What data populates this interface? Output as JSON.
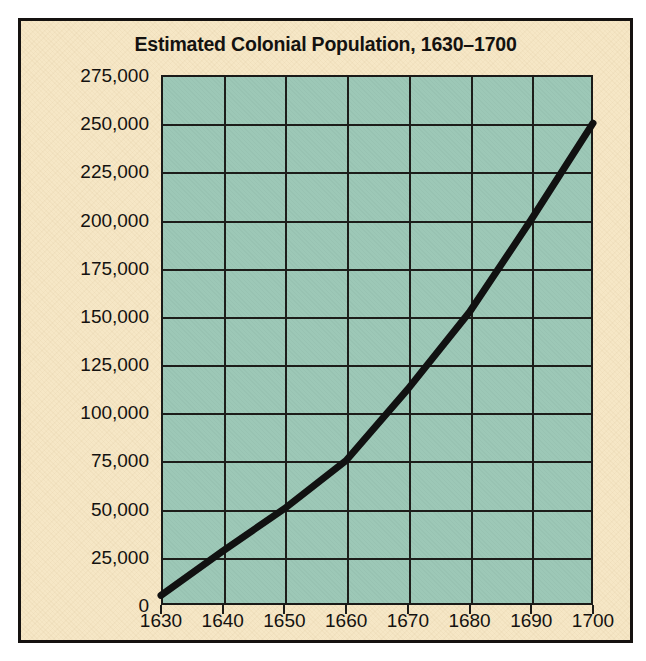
{
  "figure": {
    "background_color": "#f6e7c6",
    "border_color": "#151210",
    "plot_background_color": "#9dc8b7",
    "grid_color": "#1d1d1a",
    "line_color": "#111111"
  },
  "chart_data": {
    "type": "line",
    "title": "Estimated Colonial Population, 1630–1700",
    "xlabel": "",
    "ylabel": "",
    "x": [
      1630,
      1640,
      1650,
      1660,
      1670,
      1680,
      1690,
      1700
    ],
    "values": [
      5000,
      28000,
      50000,
      75000,
      112000,
      152000,
      200000,
      250000
    ],
    "xtick_labels": [
      "1630",
      "1640",
      "1650",
      "1660",
      "1670",
      "1680",
      "1690",
      "1700"
    ],
    "ytick_labels": [
      "275,000",
      "250,000",
      "225,000",
      "200,000",
      "175,000",
      "150,000",
      "125,000",
      "100,000",
      "75,000",
      "50,000",
      "25,000",
      "0"
    ],
    "ytick_values": [
      275000,
      250000,
      225000,
      200000,
      175000,
      150000,
      125000,
      100000,
      75000,
      50000,
      25000,
      0
    ],
    "xlim": [
      1630,
      1700
    ],
    "ylim": [
      0,
      275000
    ],
    "grid": true,
    "legend": null
  }
}
